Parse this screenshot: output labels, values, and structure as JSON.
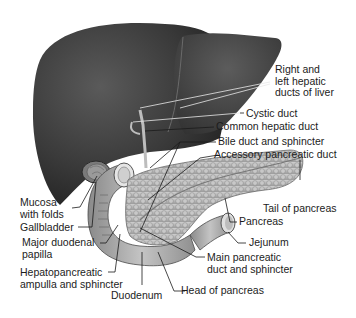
{
  "diagram": {
    "labels": {
      "right_left_hepatic": [
        "Right and",
        "left hepatic",
        "ducts of liver"
      ],
      "cystic_duct": "Cystic duct",
      "common_hepatic_duct": "Common hepatic duct",
      "bile_duct": "Bile duct and sphincter",
      "accessory_pancreatic_duct": "Accessory pancreatic duct",
      "mucosa": [
        "Mucosa",
        "with folds"
      ],
      "gallbladder": "Gallbladder",
      "major_duodenal_papilla": [
        "Major duodenal",
        "papilla"
      ],
      "hepatopancreatic": [
        "Hepatopancreatic",
        "ampulla and sphincter"
      ],
      "tail_of_pancreas": "Tail of pancreas",
      "pancreas": "Pancreas",
      "jejunum": "Jejunum",
      "main_pancreatic_duct": [
        "Main pancreatic",
        "duct and sphincter"
      ],
      "head_of_pancreas": "Head of pancreas",
      "duodenum": "Duodenum"
    },
    "colors": {
      "liver": "#3a3a3a",
      "liver_highlight": "#555555",
      "pancreas": "#b5b5b5",
      "duodenum": "#9a9a9a",
      "leader_line": "#1a1a1a",
      "background": "#ffffff"
    }
  }
}
